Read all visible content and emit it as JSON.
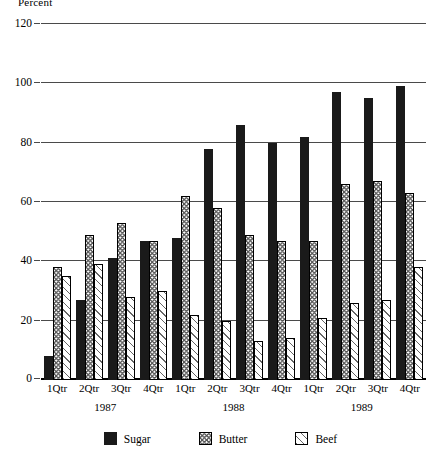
{
  "chart_data": {
    "type": "bar",
    "title": "",
    "ylabel": "Percent",
    "xlabel": "",
    "ylim": [
      0,
      120
    ],
    "yticks": [
      0,
      20,
      40,
      60,
      80,
      100,
      120
    ],
    "grid": true,
    "legend_position": "bottom",
    "categories": [
      "1Qtr",
      "2Qtr",
      "3Qtr",
      "4Qtr",
      "1Qtr",
      "2Qtr",
      "3Qtr",
      "4Qtr",
      "1Qtr",
      "2Qtr",
      "3Qtr",
      "4Qtr"
    ],
    "group_labels": [
      "1987",
      "1988",
      "1989"
    ],
    "series": [
      {
        "name": "Sugar",
        "color": "#1a1a1a",
        "pattern": "solid",
        "values": [
          8,
          27,
          41,
          47,
          48,
          78,
          86,
          80,
          82,
          97,
          95,
          99
        ]
      },
      {
        "name": "Butter",
        "color": "#555555",
        "pattern": "cross-hatch",
        "values": [
          38,
          49,
          53,
          47,
          62,
          58,
          49,
          47,
          47,
          66,
          67,
          63
        ]
      },
      {
        "name": "Beef",
        "color": "#666666",
        "pattern": "diagonal-hatch",
        "values": [
          35,
          39,
          28,
          30,
          22,
          20,
          13,
          14,
          21,
          26,
          27,
          38
        ]
      }
    ]
  }
}
